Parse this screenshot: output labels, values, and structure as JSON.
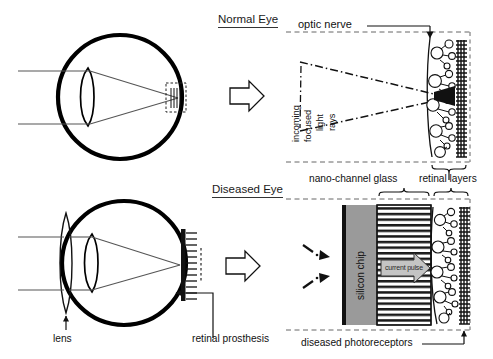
{
  "figure": {
    "title_normal": "Normal Eye",
    "title_diseased": "Diseased Eye"
  },
  "labels": {
    "optic_nerve": "optic nerve",
    "incoming": "incoming",
    "focused": "focused",
    "light_rays": "light  rays",
    "light": "light",
    "rays": "rays",
    "retinal_layers": "retinal layers",
    "nano_channel_glass": "nano-channel glass",
    "silicon_chip": "silicon chip",
    "current_pulse": "current pulse",
    "diseased_photoreceptors": "diseased photoreceptors",
    "lens": "lens",
    "retinal_prosthesis": "retinal prosthesis"
  },
  "colors": {
    "ink": "#111111",
    "outline": "#000000",
    "silicon_chip_fill": "#9a9a9a",
    "current_pulse_fill": "#b9b9b9",
    "dash_guide": "#555555"
  },
  "panels": {
    "normal_eye": {
      "name": "Normal Eye cross-section",
      "elements": [
        "eyeball-outline",
        "cornea-lens",
        "light-rays",
        "fovea-detail-box"
      ]
    },
    "normal_retina_detail": {
      "name": "Normal retina magnified detail",
      "elements": [
        "optic-nerve-arrow",
        "focused-light-cone",
        "retinal-neurons",
        "photoreceptor-array",
        "retinal-layers-brace"
      ]
    },
    "diseased_eye": {
      "name": "Diseased Eye cross-section",
      "elements": [
        "eyeball-outline",
        "external-lens",
        "cornea-lens",
        "light-rays",
        "retinal-prosthesis-implant"
      ]
    },
    "diseased_retina_detail": {
      "name": "Diseased retina with implant magnified detail",
      "elements": [
        "silicon-chip",
        "nano-channel-glass",
        "current-pulse-arrow",
        "retinal-neurons",
        "diseased-photoreceptor-array"
      ]
    }
  },
  "arrows": {
    "transition_top": "block-arrow-right",
    "transition_bottom": "block-arrow-right"
  }
}
